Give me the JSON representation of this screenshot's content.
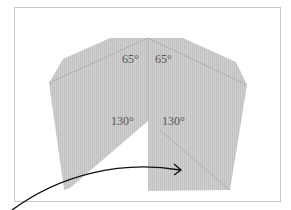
{
  "diagram": {
    "type": "folding-diagram",
    "angles": {
      "top_left": "65°",
      "top_right": "65°",
      "middle_left": "130°",
      "middle_right": "130°"
    },
    "colors": {
      "paper": "#c9c9c9",
      "crease": "#a8a8a8",
      "arrow": "#111111",
      "frame": "#c8c8c8"
    }
  }
}
